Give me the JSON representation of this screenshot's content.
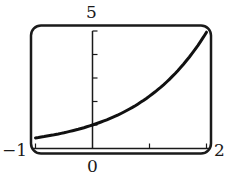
{
  "chart_data": {
    "type": "line",
    "title": "",
    "xlabel": "",
    "ylabel": "",
    "xlim": [
      -1,
      2
    ],
    "ylim": [
      0,
      5
    ],
    "x_ticks": [
      0,
      1,
      2
    ],
    "y_ticks": [
      1,
      2,
      3,
      4,
      5
    ],
    "series": [
      {
        "name": "f(x)",
        "x": [
          -1,
          -0.5,
          0,
          0.5,
          1,
          1.5,
          2
        ],
        "values": [
          0.45,
          0.67,
          1.0,
          1.49,
          2.23,
          3.32,
          4.95
        ]
      }
    ],
    "grid": false,
    "legend": null
  },
  "labels": {
    "x_min": "−1",
    "x_max": "2",
    "x_origin": "0",
    "y_max": "5"
  },
  "colors": {
    "frame": "#1a1a1a",
    "curve": "#111111",
    "background": "#ffffff"
  }
}
